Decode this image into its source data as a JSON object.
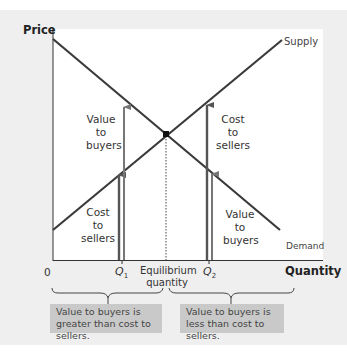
{
  "axes": {
    "y_title": "Price",
    "x_title": "Quantity",
    "origin": "0"
  },
  "curves": {
    "supply": "Supply",
    "demand": "Demand"
  },
  "x_ticks": {
    "q1_main": "Q",
    "q1_sub": "1",
    "q2_main": "Q",
    "q2_sub": "2",
    "equilibrium_line1": "Equilibrium",
    "equilibrium_line2": "quantity"
  },
  "annotations": {
    "q1_value_to_buyers": [
      "Value",
      "to",
      "buyers"
    ],
    "q1_cost_to_sellers": [
      "Cost",
      "to",
      "sellers"
    ],
    "q2_cost_to_sellers": [
      "Cost",
      "to",
      "sellers"
    ],
    "q2_value_to_buyers": [
      "Value",
      "to",
      "buyers"
    ]
  },
  "notes": {
    "left": "Value to buyers is greater than cost to sellers.",
    "right": "Value to buyers is less than cost to sellers."
  },
  "colors": {
    "curve": "#3a3a3a",
    "arrow_dark": "#555555",
    "arrow_light": "#777777",
    "panel": "#efefef",
    "note_box": "#c9c9c9"
  },
  "geometry": {
    "demand": {
      "x1": 53,
      "y1": 39,
      "x2": 280,
      "y2": 230
    },
    "supply": {
      "x1": 53,
      "y1": 230,
      "x2": 282,
      "y2": 40
    },
    "equilibrium": {
      "x": 166,
      "y": 134
    },
    "q1_x": 122,
    "q2_x": 209,
    "x_axis_y": 260
  }
}
